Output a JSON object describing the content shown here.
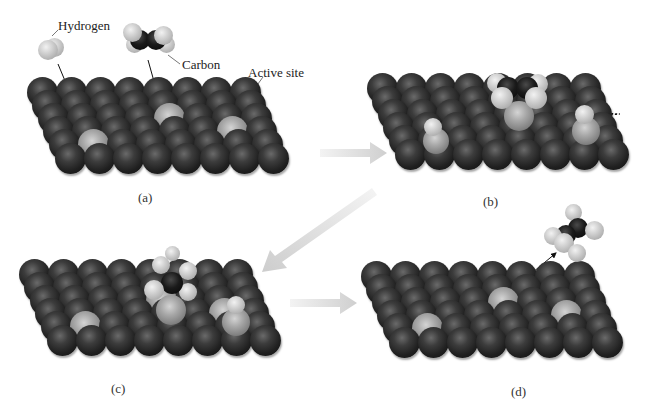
{
  "figure": {
    "labels": {
      "hydrogen": "Hydrogen",
      "carbon": "Carbon",
      "active_site": "Active site"
    },
    "panels": [
      {
        "id": "a",
        "caption": "(a)",
        "description": "H2 and ethylene approach the metal surface"
      },
      {
        "id": "b",
        "caption": "(b)",
        "description": "Adsorbed H atoms migrate across surface toward adsorbed ethylene"
      },
      {
        "id": "c",
        "caption": "(c)",
        "description": "H atoms bond to carbon atoms"
      },
      {
        "id": "d",
        "caption": "(d)",
        "description": "Ethane desorbs from the surface"
      }
    ],
    "lattice": {
      "columns": 8,
      "rows": 6
    },
    "colors": {
      "background": "#ffffff",
      "metal_atom": "#1f1f1f",
      "active_site": "#a8a8a8",
      "hydrogen": "#d2d2d2",
      "carbon": "#0a0a0a",
      "flow_arrow": "#d4d4d4",
      "path_arrow": "#111111"
    },
    "flow_arrows": [
      {
        "from": "a",
        "to": "b",
        "direction": "right"
      },
      {
        "from": "b",
        "to": "c",
        "direction": "down-left"
      },
      {
        "from": "c",
        "to": "d",
        "direction": "right"
      }
    ]
  }
}
